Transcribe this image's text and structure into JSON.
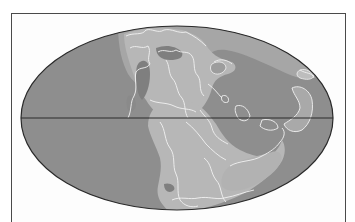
{
  "map": {
    "type": "paleogeographic world map",
    "projection": "elliptical (Mollweide-style)",
    "subject": "Pangaea supercontinent",
    "features": [
      "ocean",
      "continental-shelf",
      "land",
      "plate-boundaries",
      "equator"
    ],
    "colors": {
      "background": "#ffffff",
      "frame": "#4a4a4a",
      "ocean": "#8e8e8e",
      "shelf": "#a6a6a6",
      "land": "#b7b7b7",
      "inland_dark": "#7f7f7f",
      "outlines": "#f2f2f2",
      "ellipse_border": "#2a2a2a",
      "equator": "#2a2a2a"
    },
    "ellipse": {
      "cx": 177,
      "cy": 118,
      "rx": 156,
      "ry": 92
    },
    "equator_y": 118
  }
}
